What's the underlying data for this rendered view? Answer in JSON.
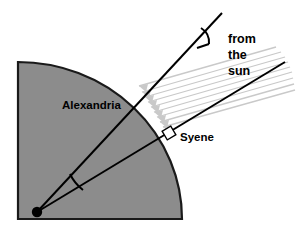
{
  "figure": {
    "background_color": "#ffffff",
    "earth_fill_color": "#8c8c8c",
    "earth_outline_color": "#1a1a1a",
    "line_color": "#000000",
    "sun_ray_color": "#c9c9c9",
    "labels": {
      "alexandria": "Alexandria",
      "syene": "Syene",
      "from_sun_line1": "from",
      "from_sun_line2": "the",
      "from_sun_line3": "sun"
    },
    "geometry": {
      "center_x": 37,
      "center_y": 212,
      "radius_x": 164,
      "radius_y": 157,
      "quarter_top_left_x": 18,
      "quarter_top_left_y": 62,
      "quarter_bottom_right_x": 182,
      "quarter_bottom_right_y": 219,
      "alexandria_point_x": 136,
      "alexandria_point_y": 107,
      "syene_point_x": 168,
      "syene_point_y": 136,
      "upper_line_end_x": 222,
      "upper_line_end_y": 13,
      "lower_line_end_x": 285,
      "lower_line_end_y": 62,
      "sun_ray_count": 9
    },
    "markers": {
      "center_dot": "center-dot",
      "angle_arc_top": "angle-arc-at-alexandria",
      "angle_arc_center": "angle-arc-at-earth-center",
      "right_angle_square": "right-angle-marker-at-syene"
    }
  }
}
